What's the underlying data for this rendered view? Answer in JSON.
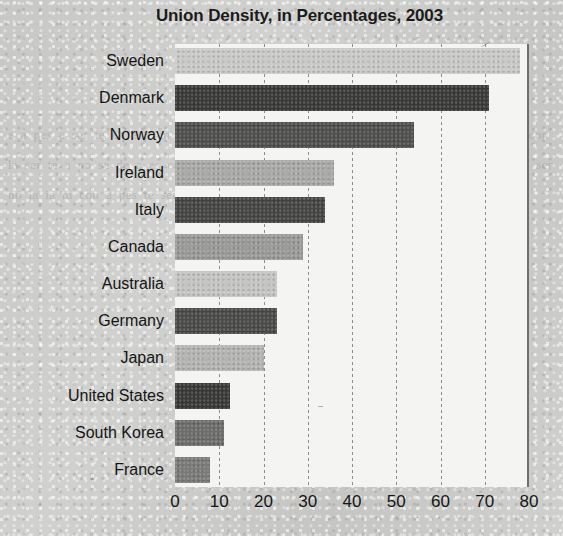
{
  "chart_data": {
    "type": "bar",
    "orientation": "horizontal",
    "title": "Union Density, in Percentages, 2003",
    "xlabel": "",
    "ylabel": "",
    "xlim": [
      0,
      80
    ],
    "xticks": [
      0,
      10,
      20,
      30,
      40,
      50,
      60,
      70,
      80
    ],
    "grid": true,
    "legend": "none",
    "categories": [
      "Sweden",
      "Denmark",
      "Norway",
      "Ireland",
      "Italy",
      "Canada",
      "Australia",
      "Germany",
      "Japan",
      "United States",
      "South Korea",
      "France"
    ],
    "values": [
      78,
      71,
      54,
      36,
      34,
      29,
      23,
      23,
      20,
      12.5,
      11,
      8
    ],
    "bar_colors": [
      "#c9c9c7",
      "#3a3a38",
      "#4f4f4d",
      "#a9a9a7",
      "#454543",
      "#9a9a98",
      "#c4c4c2",
      "#4a4a48",
      "#b4b4b2",
      "#393937",
      "#6d6d6b",
      "#7a7a78"
    ]
  },
  "page": {
    "background_color": "#cdcdcb",
    "plot_background_color": "#f4f4f2",
    "axis_color": "#6f6f6d",
    "gridline_color": "#8d8d8b",
    "text_color": "#151515",
    "bleed_text": "e a pes a ser te en este m nom a ia ser de la ser te po ce m se tra ia es ser no te con la ser te a po se de a es con la a ser de un no pes es a se con ia no ser ne es a te ser no la ia m con a pes te ser se a"
  }
}
